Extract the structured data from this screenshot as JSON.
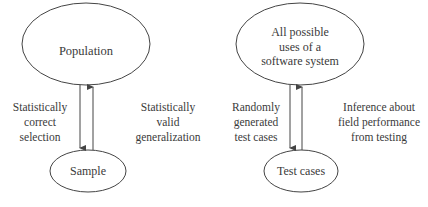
{
  "left_diagram": {
    "top_node": "Population",
    "bottom_node": "Sample",
    "down_label": [
      "Statistically",
      "correct",
      "selection"
    ],
    "up_label": [
      "Statistically",
      "valid",
      "generalization"
    ]
  },
  "right_diagram": {
    "top_node": [
      "All possible",
      "uses of a",
      "software system"
    ],
    "bottom_node": "Test cases",
    "down_label": [
      "Randomly",
      "generated",
      "test cases"
    ],
    "up_label": [
      "Inference about",
      "field performance",
      "from testing"
    ]
  },
  "colors": {
    "stroke": "#444444",
    "text": "#3a3a3a",
    "background": "#ffffff"
  }
}
